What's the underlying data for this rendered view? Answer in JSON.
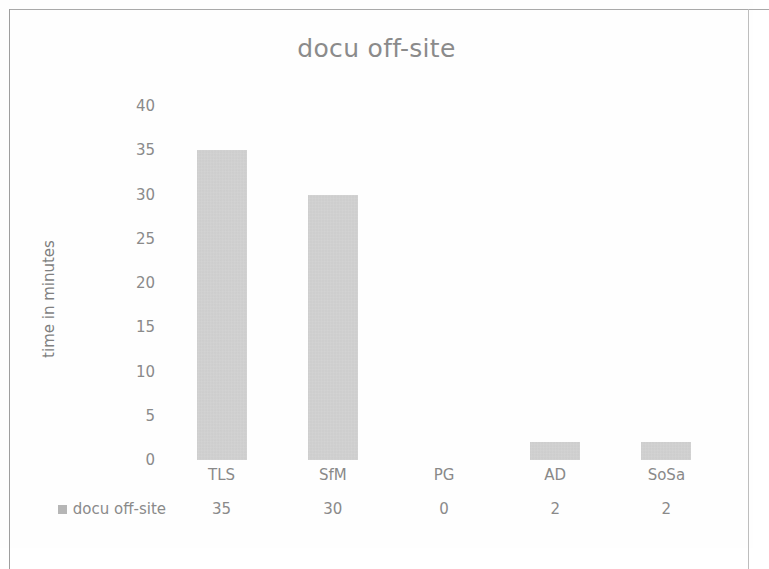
{
  "chart_data": {
    "type": "bar",
    "title": "docu off-site",
    "xlabel": "",
    "ylabel": "time in minutes",
    "categories": [
      "TLS",
      "SfM",
      "PG",
      "AD",
      "SoSa"
    ],
    "series": [
      {
        "name": "docu off-site",
        "values": [
          35,
          30,
          0,
          2,
          2
        ],
        "color": "#c6c6c6"
      }
    ],
    "ylim": [
      0,
      40
    ],
    "yticks": [
      0,
      5,
      10,
      15,
      20,
      25,
      30,
      35,
      40
    ],
    "ytick_labels": [
      "0",
      "5",
      "10",
      "15",
      "20",
      "25",
      "30",
      "35",
      "40"
    ],
    "grid": false,
    "legend_position": "bottom-data-table",
    "data_table": {
      "header": [
        "",
        "TLS",
        "SfM",
        "PG",
        "AD",
        "SoSa"
      ],
      "rows": [
        {
          "label": "docu off-site",
          "marker": "legend-swatch",
          "values": [
            "35",
            "30",
            "0",
            "2",
            "2"
          ]
        }
      ]
    }
  },
  "chart": {
    "title": "docu off-site",
    "y_axis_title": "time in minutes"
  },
  "colors": {
    "bar": "#c6c6c6",
    "text": "#8a8a8a",
    "title": "#8b8b8b",
    "frame": "#a9a9a9"
  }
}
